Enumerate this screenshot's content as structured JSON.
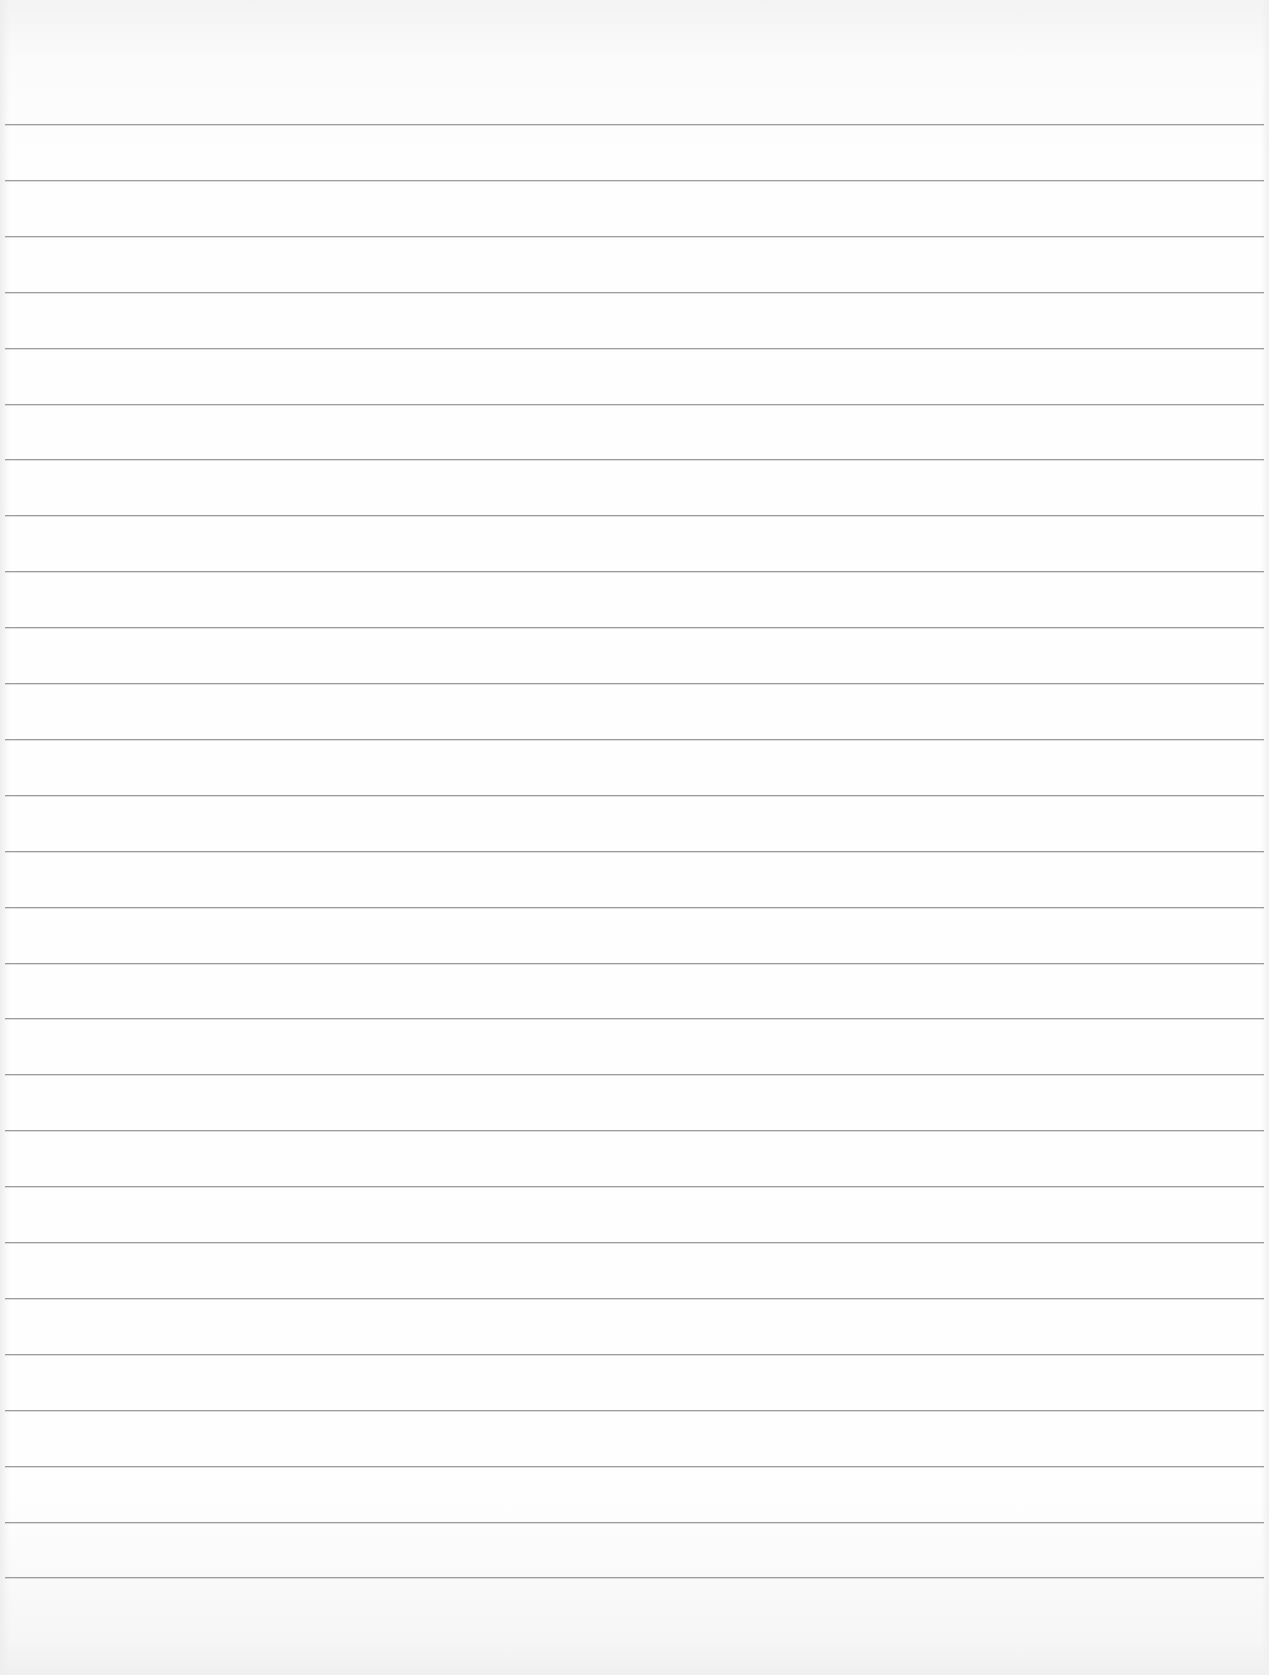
{
  "paper": {
    "type": "ruled-notebook-page",
    "background_color": "#fdfdfd",
    "line_color": "#9c9c9c",
    "line_count": 27,
    "first_line_y": 124,
    "line_spacing": 55.9,
    "line_left_x": 5,
    "line_right_x": 1264
  }
}
